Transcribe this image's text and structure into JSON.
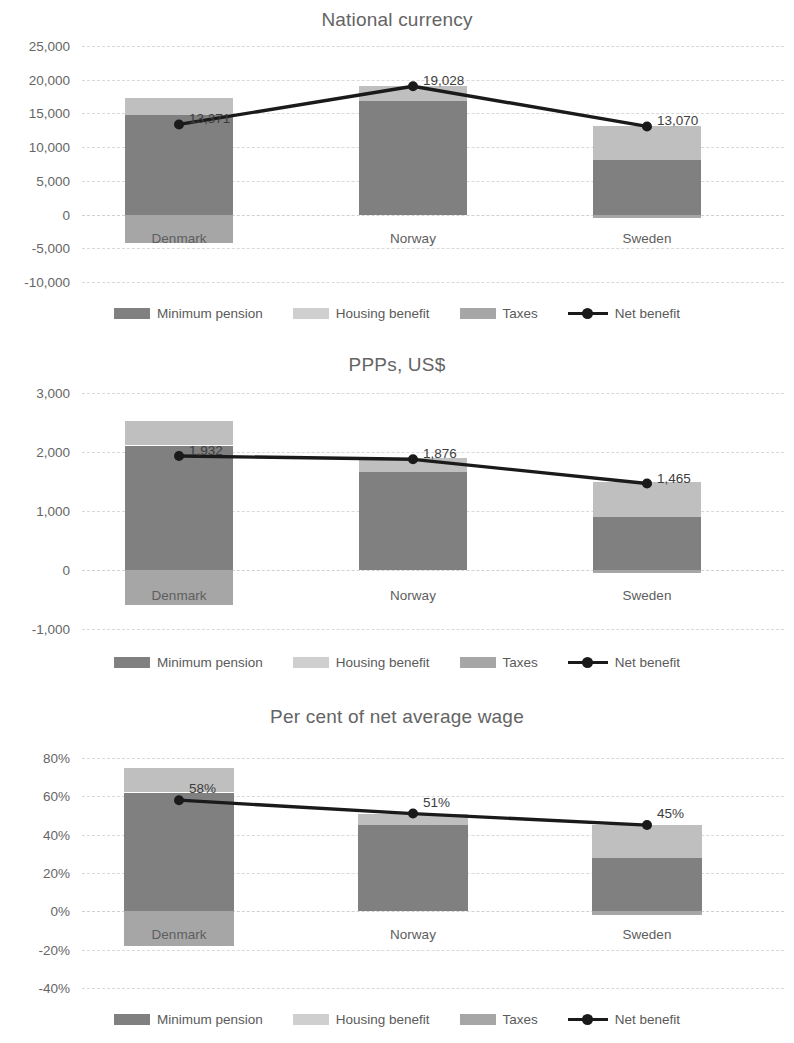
{
  "legend": {
    "items": [
      {
        "label": "Minimum pension",
        "type": "swatch",
        "key": "pension"
      },
      {
        "label": "Housing benefit",
        "type": "swatch",
        "key": "housing"
      },
      {
        "label": "Taxes",
        "type": "swatch",
        "key": "taxes"
      },
      {
        "label": "Net benefit",
        "type": "line",
        "key": "net"
      }
    ]
  },
  "colors": {
    "minimum_pension": "#808080",
    "housing_benefit": "#bfbfbf",
    "taxes": "#a6a6a6",
    "net_benefit_line": "#1a1a1a",
    "gridline": "#d9d9d9",
    "text": "#5a5a5a"
  },
  "charts": [
    {
      "id": "chart-1",
      "title": "National currency",
      "yticks": [
        "25,000",
        "20,000",
        "15,000",
        "10,000",
        "5,000",
        "0",
        "-5,000",
        "-10,000"
      ],
      "categories": [
        "Denmark",
        "Norway",
        "Sweden"
      ],
      "point_labels": [
        "13,371",
        "19,028",
        "13,070"
      ]
    },
    {
      "id": "chart-2",
      "title": "PPPs, US$",
      "yticks": [
        "3,000",
        "2,000",
        "1,000",
        "0",
        "-1,000"
      ],
      "categories": [
        "Denmark",
        "Norway",
        "Sweden"
      ],
      "point_labels": [
        "1,932",
        "1,876",
        "1,465"
      ]
    },
    {
      "id": "chart-3",
      "title": "Per cent of net average wage",
      "yticks": [
        "80%",
        "60%",
        "40%",
        "20%",
        "0%",
        "-20%",
        "-40%"
      ],
      "categories": [
        "Denmark",
        "Norway",
        "Sweden"
      ],
      "point_labels": [
        "58%",
        "51%",
        "45%"
      ]
    }
  ],
  "chart_data": [
    {
      "type": "bar",
      "title": "National currency",
      "xlabel": "",
      "ylabel": "",
      "ylim": [
        -10000,
        25000
      ],
      "ytick_values": [
        25000,
        20000,
        15000,
        10000,
        5000,
        0,
        -5000,
        -10000
      ],
      "grid": true,
      "legend_position": "bottom",
      "categories": [
        "Denmark",
        "Norway",
        "Sweden"
      ],
      "stacked": true,
      "series": [
        {
          "name": "Minimum pension",
          "values": [
            14700,
            16800,
            8100
          ]
        },
        {
          "name": "Housing benefit",
          "values": [
            2600,
            2250,
            5000
          ]
        },
        {
          "name": "Taxes",
          "values": [
            -4150,
            0,
            -450
          ]
        },
        {
          "name": "Net benefit",
          "type": "line",
          "values": [
            13371,
            19028,
            13070
          ],
          "data_labels": [
            "13,371",
            "19,028",
            "13,070"
          ]
        }
      ]
    },
    {
      "type": "bar",
      "title": "PPPs, US$",
      "xlabel": "",
      "ylabel": "",
      "ylim": [
        -1000,
        3000
      ],
      "ytick_values": [
        3000,
        2000,
        1000,
        0,
        -1000
      ],
      "grid": true,
      "legend_position": "bottom",
      "categories": [
        "Denmark",
        "Norway",
        "Sweden"
      ],
      "stacked": true,
      "series": [
        {
          "name": "Minimum pension",
          "values": [
            2110,
            1660,
            900
          ]
        },
        {
          "name": "Housing benefit",
          "values": [
            420,
            230,
            600
          ]
        },
        {
          "name": "Taxes",
          "values": [
            -600,
            0,
            -50
          ]
        },
        {
          "name": "Net benefit",
          "type": "line",
          "values": [
            1932,
            1876,
            1465
          ],
          "data_labels": [
            "1,932",
            "1,876",
            "1,465"
          ]
        }
      ]
    },
    {
      "type": "bar",
      "title": "Per cent of net average wage",
      "xlabel": "",
      "ylabel": "",
      "ylim": [
        -40,
        80
      ],
      "ytick_values": [
        80,
        60,
        40,
        20,
        0,
        -20,
        -40
      ],
      "grid": true,
      "legend_position": "bottom",
      "categories": [
        "Denmark",
        "Norway",
        "Sweden"
      ],
      "stacked": true,
      "series": [
        {
          "name": "Minimum pension",
          "values": [
            62,
            45,
            28
          ]
        },
        {
          "name": "Housing benefit",
          "values": [
            13,
            6,
            17
          ]
        },
        {
          "name": "Taxes",
          "values": [
            -18,
            0,
            -2
          ]
        },
        {
          "name": "Net benefit",
          "type": "line",
          "values": [
            58,
            51,
            45
          ],
          "data_labels": [
            "58%",
            "51%",
            "45%"
          ]
        }
      ]
    }
  ]
}
